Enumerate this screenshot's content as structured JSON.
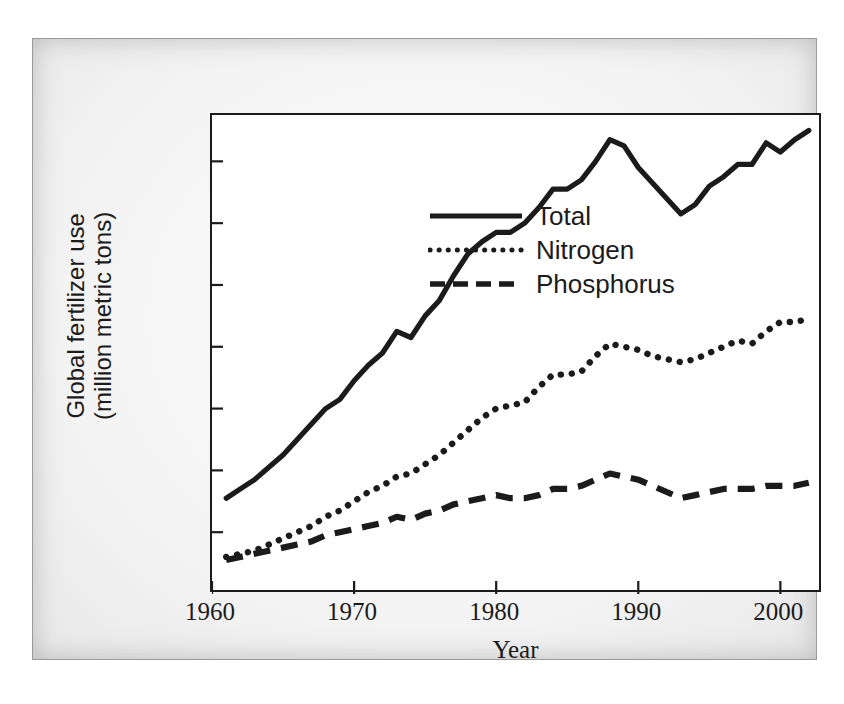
{
  "figure": {
    "background_color": "#efefef",
    "plot_background_color": "#ffffff",
    "line_color": "#1b1b1b"
  },
  "axis": {
    "ylabel_line1": "Global fertilizer use",
    "ylabel_line2": "(million metric tons)",
    "xlabel": "Year",
    "ytick_labels": [
      "0",
      "20",
      "40",
      "60",
      "80",
      "100",
      "120",
      "140"
    ],
    "xtick_labels": [
      "1960",
      "1970",
      "1980",
      "1990",
      "2000"
    ]
  },
  "legend": {
    "items": [
      {
        "label": "Total",
        "style": "solid",
        "icon": "solid-line-icon"
      },
      {
        "label": "Nitrogen",
        "style": "dotted",
        "icon": "dotted-line-icon"
      },
      {
        "label": "Phosphorus",
        "style": "dashed",
        "icon": "dashed-line-icon"
      }
    ]
  },
  "chart_data": {
    "type": "line",
    "title": "",
    "xlabel": "Year",
    "ylabel": "Global fertilizer use (million metric tons)",
    "xlim": [
      1960,
      2003
    ],
    "ylim": [
      0,
      155
    ],
    "xticks": [
      1960,
      1970,
      1980,
      1990,
      2000
    ],
    "yticks": [
      0,
      20,
      40,
      60,
      80,
      100,
      120,
      140
    ],
    "grid": false,
    "legend_position": "top-left",
    "x": [
      1961,
      1962,
      1963,
      1964,
      1965,
      1966,
      1967,
      1968,
      1969,
      1970,
      1971,
      1972,
      1973,
      1974,
      1975,
      1976,
      1977,
      1978,
      1979,
      1980,
      1981,
      1982,
      1983,
      1984,
      1985,
      1986,
      1987,
      1988,
      1989,
      1990,
      1991,
      1992,
      1993,
      1994,
      1995,
      1996,
      1997,
      1998,
      1999,
      2000,
      2001,
      2002
    ],
    "series": [
      {
        "name": "Total",
        "style": "solid",
        "values": [
          31,
          34,
          37,
          41,
          45,
          50,
          55,
          60,
          63,
          69,
          74,
          78,
          85,
          83,
          90,
          95,
          103,
          110,
          114,
          117,
          117,
          120,
          125,
          131,
          131,
          134,
          140,
          147,
          145,
          138,
          133,
          128,
          123,
          126,
          132,
          135,
          139,
          139,
          146,
          143,
          147,
          150
        ]
      },
      {
        "name": "Nitrogen",
        "style": "dotted",
        "values": [
          12,
          13,
          14,
          16,
          18,
          20,
          22,
          25,
          27,
          30,
          33,
          35,
          38,
          39,
          42,
          45,
          49,
          53,
          57,
          60,
          61,
          62,
          67,
          71,
          71,
          72,
          77,
          81,
          80,
          79,
          77,
          76,
          75,
          76,
          78,
          80,
          82,
          81,
          85,
          88,
          88,
          89
        ]
      },
      {
        "name": "Phosphorus",
        "style": "dashed",
        "values": [
          11,
          12,
          13,
          14,
          15,
          16,
          17,
          19,
          20,
          21,
          22,
          23,
          25,
          24,
          26,
          27,
          29,
          30,
          31,
          32,
          31,
          31,
          32,
          34,
          34,
          35,
          37,
          39,
          38,
          37,
          35,
          33,
          31,
          32,
          33,
          34,
          34,
          34,
          35,
          35,
          35,
          36
        ]
      }
    ]
  }
}
